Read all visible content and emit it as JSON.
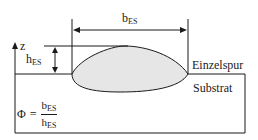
{
  "diagram": {
    "width_label": {
      "base": "b",
      "sub": "ES"
    },
    "height_label": {
      "base": "h",
      "sub": "ES"
    },
    "axis_label": "z",
    "bead_label": "Einzelspur",
    "substrate_label": "Substrat",
    "formula": {
      "lhs": "Φ",
      "eq": "=",
      "numerator": {
        "base": "b",
        "sub": "ES"
      },
      "denominator": {
        "base": "h",
        "sub": "ES"
      }
    },
    "colors": {
      "line": "#1a1a1a",
      "bead_fill": "#e6e6e6",
      "background": "#ffffff"
    }
  }
}
